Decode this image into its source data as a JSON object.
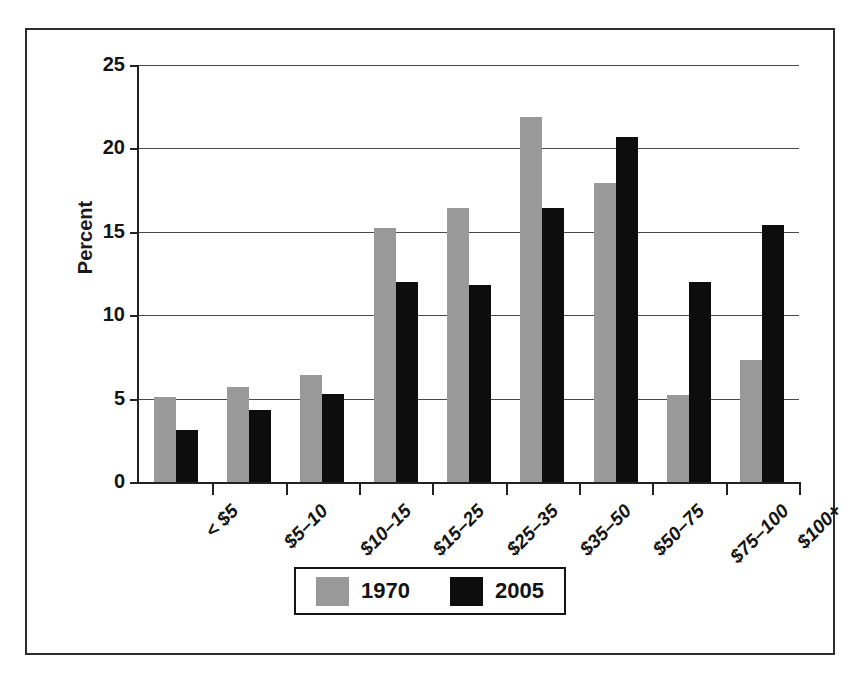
{
  "chart_data": {
    "type": "bar",
    "title": "",
    "xlabel": "",
    "ylabel": "Percent",
    "ylim": [
      0,
      25
    ],
    "yticks": [
      0,
      5,
      10,
      15,
      20,
      25
    ],
    "grid": true,
    "legend_position": "bottom-center",
    "categories": [
      "< $5",
      "$5–10",
      "$10–15",
      "$15–25",
      "$25–35",
      "$35–50",
      "$50–75",
      "$75–100",
      "$100+"
    ],
    "series": [
      {
        "name": "1970",
        "color": "#999999",
        "values": [
          5.1,
          5.7,
          6.4,
          15.2,
          16.4,
          21.9,
          17.9,
          5.2,
          7.3
        ]
      },
      {
        "name": "2005",
        "color": "#0d0d0d",
        "values": [
          3.1,
          4.3,
          5.3,
          12.0,
          11.8,
          16.4,
          20.7,
          12.0,
          15.4
        ]
      }
    ]
  },
  "axis": {
    "y_title": "Percent",
    "y_tick_labels": [
      "0",
      "5",
      "10",
      "15",
      "20",
      "25"
    ]
  },
  "legend": {
    "entries": [
      {
        "label": "1970",
        "color": "#999999"
      },
      {
        "label": "2005",
        "color": "#0d0d0d"
      }
    ]
  },
  "colors": {
    "series_1970": "#999999",
    "series_2005": "#0d0d0d",
    "axis": "#222222",
    "gridline": "#4a4a4a",
    "frame": "#2b2b2b",
    "background": "#ffffff"
  }
}
